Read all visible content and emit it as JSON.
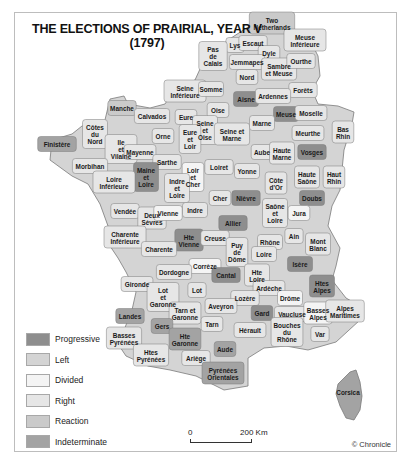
{
  "title": {
    "line1": "THE ELECTIONS OF PRAIRIAL, YEAR V",
    "line2": "(1797)"
  },
  "colors": {
    "progressive": "#8e8e8e",
    "left": "#d4d4d4",
    "divided": "#f4f4f4",
    "right": "#e6e6e6",
    "reaction": "#cacaca",
    "indeterminate": "#a3a3a3",
    "border": "#7a7a7a"
  },
  "legend": [
    {
      "key": "progressive",
      "label": "Progressive",
      "color": "#8e8e8e"
    },
    {
      "key": "left",
      "label": "Left",
      "color": "#d4d4d4"
    },
    {
      "key": "divided",
      "label": "Divided",
      "color": "#f4f4f4"
    },
    {
      "key": "right",
      "label": "Right",
      "color": "#e6e6e6"
    },
    {
      "key": "reaction",
      "label": "Reaction",
      "color": "#cacaca"
    },
    {
      "key": "indeterminate",
      "label": "Indeterminate",
      "color": "#a3a3a3"
    }
  ],
  "scale": {
    "start": "0",
    "end": "200 Km"
  },
  "credit": "© Chronicle",
  "departments": [
    {
      "name": "Two Netherlands",
      "lines": [
        "Two",
        "Netherlands"
      ],
      "x": 272,
      "y": 24,
      "cat": "reaction"
    },
    {
      "name": "Lys",
      "lines": [
        "Lys"
      ],
      "x": 235,
      "y": 46,
      "cat": "right"
    },
    {
      "name": "Escaut",
      "lines": [
        "Escaut"
      ],
      "x": 253,
      "y": 44,
      "cat": "right"
    },
    {
      "name": "Meuse Inférieure",
      "lines": [
        "Meuse",
        "Inférieure"
      ],
      "x": 305,
      "y": 41,
      "cat": "right"
    },
    {
      "name": "Dyle",
      "lines": [
        "Dyle"
      ],
      "x": 269,
      "y": 54,
      "cat": "right"
    },
    {
      "name": "Pas de Calais",
      "lines": [
        "Pas",
        "de",
        "Calais"
      ],
      "x": 213,
      "y": 57,
      "cat": "right"
    },
    {
      "name": "Jemmapes",
      "lines": [
        "Jemmapes"
      ],
      "x": 247,
      "y": 63,
      "cat": "right"
    },
    {
      "name": "Sambre et Meuse",
      "lines": [
        "Sambre",
        "et Meuse"
      ],
      "x": 279,
      "y": 70,
      "cat": "right"
    },
    {
      "name": "Ourthe",
      "lines": [
        "Ourthe"
      ],
      "x": 301,
      "y": 62,
      "cat": "right"
    },
    {
      "name": "Nord",
      "lines": [
        "Nord"
      ],
      "x": 247,
      "y": 78,
      "cat": "right"
    },
    {
      "name": "Forêts",
      "lines": [
        "Forêts"
      ],
      "x": 303,
      "y": 91,
      "cat": "right"
    },
    {
      "name": "Seine Inférieure",
      "lines": [
        "Seine",
        "Inférieure"
      ],
      "x": 185,
      "y": 92,
      "cat": "right"
    },
    {
      "name": "Somme",
      "lines": [
        "Somme"
      ],
      "x": 211,
      "y": 90,
      "cat": "right"
    },
    {
      "name": "Aisne",
      "lines": [
        "Aisne"
      ],
      "x": 246,
      "y": 100,
      "cat": "progressive"
    },
    {
      "name": "Ardennes",
      "lines": [
        "Ardennes"
      ],
      "x": 273,
      "y": 97,
      "cat": "right"
    },
    {
      "name": "Manche",
      "lines": [
        "Manche"
      ],
      "x": 122,
      "y": 109,
      "cat": "reaction"
    },
    {
      "name": "Calvados",
      "lines": [
        "Calvados"
      ],
      "x": 152,
      "y": 117,
      "cat": "right"
    },
    {
      "name": "Eure",
      "lines": [
        "Eure"
      ],
      "x": 186,
      "y": 118,
      "cat": "right"
    },
    {
      "name": "Oise",
      "lines": [
        "Oise"
      ],
      "x": 218,
      "y": 111,
      "cat": "right"
    },
    {
      "name": "Meuse",
      "lines": [
        "Meuse"
      ],
      "x": 286,
      "y": 115,
      "cat": "progressive"
    },
    {
      "name": "Moselle",
      "lines": [
        "Moselle"
      ],
      "x": 311,
      "y": 114,
      "cat": "right"
    },
    {
      "name": "Seine et Oise",
      "lines": [
        "Seine",
        "et",
        "Oise"
      ],
      "x": 205,
      "y": 131,
      "cat": "right"
    },
    {
      "name": "Seine et Marne",
      "lines": [
        "Seine et",
        "Marne"
      ],
      "x": 232,
      "y": 135,
      "cat": "right"
    },
    {
      "name": "Marne",
      "lines": [
        "Marne"
      ],
      "x": 262,
      "y": 124,
      "cat": "right"
    },
    {
      "name": "Bas Rhin",
      "lines": [
        "Bas",
        "Rhin"
      ],
      "x": 343,
      "y": 133,
      "cat": "right"
    },
    {
      "name": "Finistère",
      "lines": [
        "Finistère"
      ],
      "x": 57,
      "y": 145,
      "cat": "indeterminate"
    },
    {
      "name": "Côtes du Nord",
      "lines": [
        "Côtes",
        "du",
        "Nord"
      ],
      "x": 95,
      "y": 135,
      "cat": "right"
    },
    {
      "name": "Orne",
      "lines": [
        "Orne"
      ],
      "x": 163,
      "y": 137,
      "cat": "right"
    },
    {
      "name": "Eure et Loir",
      "lines": [
        "Eure",
        "et",
        "Loir"
      ],
      "x": 190,
      "y": 140,
      "cat": "right"
    },
    {
      "name": "Meurthe",
      "lines": [
        "Meurthe"
      ],
      "x": 308,
      "y": 134,
      "cat": "right"
    },
    {
      "name": "Ille et Vilaine",
      "lines": [
        "Ile",
        "et",
        "Vilaine"
      ],
      "x": 121,
      "y": 150,
      "cat": "right"
    },
    {
      "name": "Mayenne",
      "lines": [
        "Mayenne"
      ],
      "x": 140,
      "y": 153,
      "cat": "right"
    },
    {
      "name": "Aube",
      "lines": [
        "Aube"
      ],
      "x": 262,
      "y": 153,
      "cat": "right"
    },
    {
      "name": "Haute Marne",
      "lines": [
        "Haute",
        "Marne"
      ],
      "x": 282,
      "y": 154,
      "cat": "right"
    },
    {
      "name": "Vosges",
      "lines": [
        "Vosges"
      ],
      "x": 312,
      "y": 153,
      "cat": "progressive"
    },
    {
      "name": "Morbihan",
      "lines": [
        "Morbihan"
      ],
      "x": 90,
      "y": 167,
      "cat": "right"
    },
    {
      "name": "Sarthe",
      "lines": [
        "Sarthe"
      ],
      "x": 167,
      "y": 163,
      "cat": "right"
    },
    {
      "name": "Loiret",
      "lines": [
        "Loiret"
      ],
      "x": 219,
      "y": 168,
      "cat": "right"
    },
    {
      "name": "Yonne",
      "lines": [
        "Yonne"
      ],
      "x": 247,
      "y": 172,
      "cat": "right"
    },
    {
      "name": "Côte d'Or",
      "lines": [
        "Côte",
        "d'Or"
      ],
      "x": 276,
      "y": 184,
      "cat": "right"
    },
    {
      "name": "Haute Saône",
      "lines": [
        "Haute",
        "Saône"
      ],
      "x": 307,
      "y": 178,
      "cat": "right"
    },
    {
      "name": "Haut Rhin",
      "lines": [
        "Haut",
        "Rhin"
      ],
      "x": 334,
      "y": 178,
      "cat": "right"
    },
    {
      "name": "Loir et Cher",
      "lines": [
        "Loir",
        "et",
        "Cher"
      ],
      "x": 193,
      "y": 178,
      "cat": "divided"
    },
    {
      "name": "Maine et Loire",
      "lines": [
        "Maine",
        "et",
        "Loire"
      ],
      "x": 146,
      "y": 178,
      "cat": "progressive"
    },
    {
      "name": "Loire Inférieure",
      "lines": [
        "Loire",
        "Inférieure"
      ],
      "x": 114,
      "y": 183,
      "cat": "right"
    },
    {
      "name": "Indre et Loire",
      "lines": [
        "Indre",
        "et",
        "Loire"
      ],
      "x": 177,
      "y": 189,
      "cat": "right"
    },
    {
      "name": "Cher",
      "lines": [
        "Cher"
      ],
      "x": 220,
      "y": 199,
      "cat": "right"
    },
    {
      "name": "Nièvre",
      "lines": [
        "Nièvre"
      ],
      "x": 246,
      "y": 199,
      "cat": "progressive"
    },
    {
      "name": "Doubs",
      "lines": [
        "Doubs"
      ],
      "x": 312,
      "y": 199,
      "cat": "progressive"
    },
    {
      "name": "Vendée",
      "lines": [
        "Vendée"
      ],
      "x": 125,
      "y": 212,
      "cat": "right"
    },
    {
      "name": "Deux Sèvres",
      "lines": [
        "Deux",
        "Sèvres"
      ],
      "x": 152,
      "y": 219,
      "cat": "right"
    },
    {
      "name": "Vienne",
      "lines": [
        "Vienne"
      ],
      "x": 168,
      "y": 214,
      "cat": "divided"
    },
    {
      "name": "Indre",
      "lines": [
        "Indre"
      ],
      "x": 195,
      "y": 211,
      "cat": "right"
    },
    {
      "name": "Saône et Loire",
      "lines": [
        "Saône",
        "et",
        "Loire"
      ],
      "x": 275,
      "y": 214,
      "cat": "right"
    },
    {
      "name": "Jura",
      "lines": [
        "Jura"
      ],
      "x": 299,
      "y": 214,
      "cat": "divided"
    },
    {
      "name": "Allier",
      "lines": [
        "Allier"
      ],
      "x": 233,
      "y": 224,
      "cat": "progressive"
    },
    {
      "name": "Ain",
      "lines": [
        "Ain"
      ],
      "x": 294,
      "y": 237,
      "cat": "right"
    },
    {
      "name": "Rhône",
      "lines": [
        "Rhône"
      ],
      "x": 270,
      "y": 243,
      "cat": "right"
    },
    {
      "name": "Mont Blanc",
      "lines": [
        "Mont",
        "Blanc"
      ],
      "x": 318,
      "y": 245,
      "cat": "right"
    },
    {
      "name": "Charente Inférieure",
      "lines": [
        "Charente",
        "Inférieure"
      ],
      "x": 125,
      "y": 238,
      "cat": "right"
    },
    {
      "name": "Hte Vienne",
      "lines": [
        "Hte",
        "Vienne"
      ],
      "x": 189,
      "y": 241,
      "cat": "progressive"
    },
    {
      "name": "Creuse",
      "lines": [
        "Creuse"
      ],
      "x": 215,
      "y": 239,
      "cat": "right"
    },
    {
      "name": "Charente",
      "lines": [
        "Charente"
      ],
      "x": 159,
      "y": 250,
      "cat": "right"
    },
    {
      "name": "Puy de Dôme",
      "lines": [
        "Puy",
        "de",
        "Dôme"
      ],
      "x": 237,
      "y": 253,
      "cat": "right"
    },
    {
      "name": "Loire",
      "lines": [
        "Loire"
      ],
      "x": 264,
      "y": 255,
      "cat": "right"
    },
    {
      "name": "Isère",
      "lines": [
        "Isère"
      ],
      "x": 300,
      "y": 265,
      "cat": "progressive"
    },
    {
      "name": "Corrèze",
      "lines": [
        "Corrèze"
      ],
      "x": 205,
      "y": 267,
      "cat": "divided"
    },
    {
      "name": "Dordogne",
      "lines": [
        "Dordogne"
      ],
      "x": 174,
      "y": 273,
      "cat": "right"
    },
    {
      "name": "Cantal",
      "lines": [
        "Cantal"
      ],
      "x": 226,
      "y": 276,
      "cat": "progressive"
    },
    {
      "name": "Hte Loire",
      "lines": [
        "Hte",
        "Loire"
      ],
      "x": 257,
      "y": 276,
      "cat": "right"
    },
    {
      "name": "Htes Alpes",
      "lines": [
        "Htes",
        "Alpes"
      ],
      "x": 322,
      "y": 287,
      "cat": "progressive"
    },
    {
      "name": "Gironde",
      "lines": [
        "Gironde"
      ],
      "x": 137,
      "y": 285,
      "cat": "right"
    },
    {
      "name": "Lot",
      "lines": [
        "Lot"
      ],
      "x": 197,
      "y": 291,
      "cat": "right"
    },
    {
      "name": "Ardèche",
      "lines": [
        "Ardèche"
      ],
      "x": 269,
      "y": 289,
      "cat": "right"
    },
    {
      "name": "Lot et Garonne",
      "lines": [
        "Lot",
        "et",
        "Garonne"
      ],
      "x": 163,
      "y": 298,
      "cat": "right"
    },
    {
      "name": "Lozère",
      "lines": [
        "Lozère"
      ],
      "x": 245,
      "y": 299,
      "cat": "right"
    },
    {
      "name": "Drôme",
      "lines": [
        "Drôme"
      ],
      "x": 290,
      "y": 299,
      "cat": "divided"
    },
    {
      "name": "Landes",
      "lines": [
        "Landes"
      ],
      "x": 130,
      "y": 317,
      "cat": "indeterminate"
    },
    {
      "name": "Tarn et Garonne",
      "lines": [
        "Tarn et",
        "Garonne"
      ],
      "x": 185,
      "y": 314,
      "cat": "right"
    },
    {
      "name": "Aveyron",
      "lines": [
        "Aveyron"
      ],
      "x": 221,
      "y": 307,
      "cat": "right"
    },
    {
      "name": "Gard",
      "lines": [
        "Gard"
      ],
      "x": 262,
      "y": 314,
      "cat": "progressive"
    },
    {
      "name": "Vaucluse",
      "lines": [
        "Vaucluse"
      ],
      "x": 292,
      "y": 315,
      "cat": "right"
    },
    {
      "name": "Basses Alpes",
      "lines": [
        "Basses",
        "Alpes"
      ],
      "x": 318,
      "y": 314,
      "cat": "divided"
    },
    {
      "name": "Alpes Maritimes",
      "lines": [
        "Alpes",
        "Maritimes"
      ],
      "x": 345,
      "y": 312,
      "cat": "right"
    },
    {
      "name": "Gers",
      "lines": [
        "Gers"
      ],
      "x": 162,
      "y": 327,
      "cat": "indeterminate"
    },
    {
      "name": "Tarn",
      "lines": [
        "Tarn"
      ],
      "x": 212,
      "y": 325,
      "cat": "right"
    },
    {
      "name": "Hérault",
      "lines": [
        "Hérault"
      ],
      "x": 250,
      "y": 331,
      "cat": "right"
    },
    {
      "name": "Bouches du Rhône",
      "lines": [
        "Bouches",
        "du",
        "Rhône"
      ],
      "x": 287,
      "y": 333,
      "cat": "right"
    },
    {
      "name": "Var",
      "lines": [
        "Var"
      ],
      "x": 320,
      "y": 335,
      "cat": "right"
    },
    {
      "name": "Basses Pyrénées",
      "lines": [
        "Basses",
        "Pyrénées"
      ],
      "x": 124,
      "y": 339,
      "cat": "right"
    },
    {
      "name": "Hte Garonne",
      "lines": [
        "Hte",
        "Garonne"
      ],
      "x": 185,
      "y": 340,
      "cat": "indeterminate"
    },
    {
      "name": "Aude",
      "lines": [
        "Aude"
      ],
      "x": 225,
      "y": 350,
      "cat": "indeterminate"
    },
    {
      "name": "Htes Pyrénées",
      "lines": [
        "Htes",
        "Pyrénées"
      ],
      "x": 151,
      "y": 356,
      "cat": "right"
    },
    {
      "name": "Ariège",
      "lines": [
        "Ariège"
      ],
      "x": 196,
      "y": 359,
      "cat": "right"
    },
    {
      "name": "Pyrénées Orientales",
      "lines": [
        "Pyrénées",
        "Orientales"
      ],
      "x": 223,
      "y": 374,
      "cat": "indeterminate"
    },
    {
      "name": "Corsica",
      "lines": [
        "Corsica"
      ],
      "x": 348,
      "y": 393,
      "cat": "indeterminate"
    }
  ]
}
